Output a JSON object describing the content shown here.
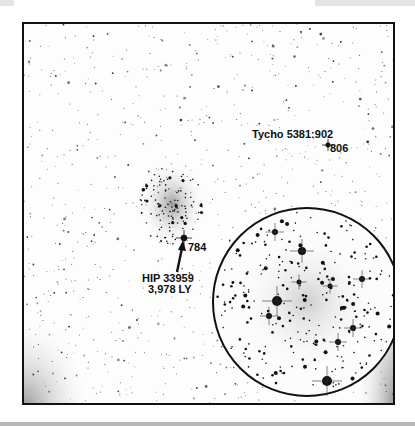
{
  "image": {
    "description": "Inverted (negative) astronomical star field photograph of an open star cluster with annotations and a circular zoomed inset",
    "colors": {
      "background": "#ffffff",
      "stars": "#111111",
      "frame": "#111111"
    }
  },
  "annotations": {
    "tycho_label": "Tycho 5381:902",
    "tycho_value": "806",
    "cluster_star_value": "784",
    "hip_label": "HIP 33959",
    "hip_distance": "3,978 LY"
  },
  "inset": {
    "shape": "circle",
    "content": "magnified view of the star cluster"
  }
}
